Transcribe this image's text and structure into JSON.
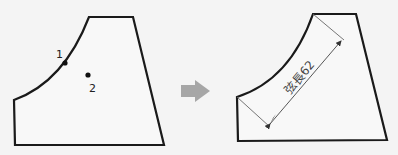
{
  "diagram": {
    "before": {
      "point_labels": [
        "1",
        "2"
      ]
    },
    "arrow": {
      "icon": "right-arrow-icon",
      "color": "#a6a6a6"
    },
    "after": {
      "dimension_label": "弦長62"
    },
    "colors": {
      "outline": "#1a1a1a",
      "dimension": "#555555",
      "background": "#f4f4f4",
      "fill": "#f8f8f8"
    }
  }
}
